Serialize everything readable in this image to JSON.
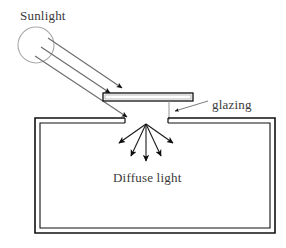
{
  "figure": {
    "background_color": "#ffffff"
  },
  "labels": {
    "sunlight": "Sunlight",
    "glazing": "glazing",
    "diffuse_light": "Diffuse light"
  },
  "colors": {
    "stroke_dark": "#1a1a1a",
    "stroke_medium": "#4d4d4d",
    "stroke_light": "#9a9a9a",
    "text": "#3a3a3a",
    "fill_white": "#ffffff"
  },
  "elements": {
    "sun": {
      "name": "sun-circle",
      "cx": 36,
      "cy": 45,
      "r": 18,
      "stroke": "#a8a8a8",
      "fill": "#ffffff"
    },
    "sun_rays": {
      "name": "sunlight-rays",
      "count": 3,
      "rays": [
        {
          "x1": 48,
          "y1": 38,
          "x2": 122,
          "y2": 88
        },
        {
          "x1": 41,
          "y1": 47,
          "x2": 110,
          "y2": 93
        },
        {
          "x1": 35,
          "y1": 56,
          "x2": 127,
          "y2": 117
        }
      ]
    },
    "glazing_panel": {
      "name": "glazing-panel",
      "x": 103,
      "y": 93,
      "width": 90,
      "height": 8
    },
    "glazing_support": {
      "name": "glazing-support-line",
      "x": 169,
      "y1": 101,
      "y2": 120
    },
    "glazing_leader": {
      "name": "glazing-leader-line",
      "x1": 208,
      "y1": 101,
      "x2": 175,
      "y2": 111
    },
    "enclosure": {
      "name": "enclosure-box",
      "outer": {
        "x": 35,
        "y": 118,
        "width": 240,
        "height": 115
      },
      "inner_inset": 5,
      "aperture": {
        "x_start": 125,
        "x_end": 168
      }
    },
    "diffuse_rays": {
      "name": "diffuse-light-rays",
      "apex": {
        "x": 146,
        "y": 124
      },
      "count": 5,
      "tips": [
        {
          "x": 119,
          "y": 143
        },
        {
          "x": 131,
          "y": 156
        },
        {
          "x": 146,
          "y": 161
        },
        {
          "x": 161,
          "y": 156
        },
        {
          "x": 173,
          "y": 143
        }
      ]
    }
  }
}
